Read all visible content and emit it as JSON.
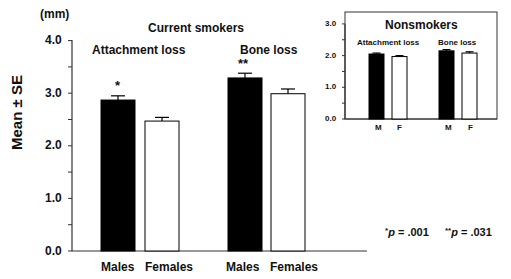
{
  "chart_data": [
    {
      "type": "bar",
      "title": "Current smokers",
      "ylabel": "Mean ± SE",
      "yunit": "(mm)",
      "ylim": [
        0,
        4
      ],
      "yticks": [
        "0.0",
        "1.0",
        "2.0",
        "3.0",
        "4.0"
      ],
      "groups": [
        {
          "name": "Attachment loss",
          "categories": [
            "Males",
            "Females"
          ],
          "values": [
            2.87,
            2.47
          ],
          "se": [
            0.08,
            0.07
          ],
          "annotations": [
            "*",
            ""
          ]
        },
        {
          "name": "Bone loss",
          "categories": [
            "Males",
            "Females"
          ],
          "values": [
            3.29,
            2.99
          ],
          "se": [
            0.09,
            0.09
          ],
          "annotations": [
            "**",
            ""
          ]
        }
      ],
      "series_colors": {
        "Males": "#000000",
        "Females": "#ffffff"
      },
      "footnote": "*p = .001   **p = .031"
    },
    {
      "type": "bar",
      "title": "Nonsmokers",
      "ylim": [
        0,
        3
      ],
      "yticks": [
        "0.0",
        "1.0",
        "2.0",
        "3.0"
      ],
      "groups": [
        {
          "name": "Attachment loss",
          "categories": [
            "M",
            "F"
          ],
          "values": [
            2.05,
            1.97
          ],
          "se": [
            0.03,
            0.03
          ]
        },
        {
          "name": "Bone loss",
          "categories": [
            "M",
            "F"
          ],
          "values": [
            2.15,
            2.08
          ],
          "se": [
            0.04,
            0.04
          ]
        }
      ]
    }
  ],
  "labels": {
    "unit": "(mm)",
    "main_title": "Current smokers",
    "ylabel": "Mean ± SE",
    "group1": "Attachment loss",
    "group2": "Bone loss",
    "star1": "*",
    "star2": "**",
    "males": "Males",
    "females": "Females",
    "inset_title": "Nonsmokers",
    "inset_group1": "Attachment loss",
    "inset_group2": "Bone loss",
    "m": "M",
    "f": "F",
    "footnote1_star": "*",
    "footnote1_p": "p",
    "footnote1_val": " = .001",
    "footnote2_star": "**",
    "footnote2_p": "p",
    "footnote2_val": " = .031",
    "yticks_main": [
      "4.0",
      "3.0",
      "2.0",
      "1.0",
      "0.0"
    ],
    "yticks_inset": [
      "3.0",
      "2.0",
      "1.0",
      "0.0"
    ]
  }
}
